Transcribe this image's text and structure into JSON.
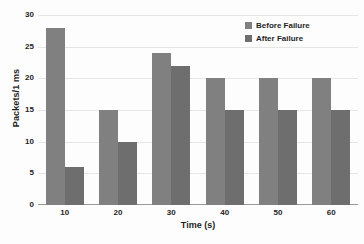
{
  "chart_data": {
    "type": "bar",
    "title": "",
    "xlabel": "Time (s)",
    "ylabel": "Packets/1 ms",
    "categories": [
      "10",
      "20",
      "30",
      "40",
      "50",
      "60"
    ],
    "series": [
      {
        "name": "Before Failure",
        "color": "#808080",
        "values": [
          28,
          15,
          24,
          20,
          20,
          20
        ]
      },
      {
        "name": "After Failure",
        "color": "#6e6e6e",
        "values": [
          6,
          10,
          22,
          15,
          15,
          15
        ]
      }
    ],
    "ylim": [
      0,
      30
    ],
    "yticks": [
      "0",
      "5",
      "10",
      "15",
      "20",
      "25",
      "30"
    ],
    "ytick_values": [
      0,
      5,
      10,
      15,
      20,
      25,
      30
    ],
    "grid": true,
    "legend_position": "top-right",
    "background_color": "#fdfdfd",
    "gridline_color": "#e6e6e6",
    "axis_color": "#9a9a9a"
  }
}
